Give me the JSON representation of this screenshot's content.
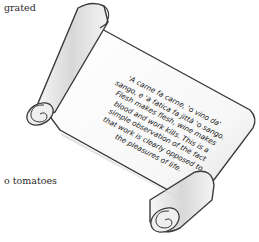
{
  "page": {
    "partial_text_top": "grated",
    "partial_text_bottom": "o tomatoes"
  },
  "scroll": {
    "quote_lines": [
      "'A carne fa carne, 'o vino da'",
      "sango, e 'a fatica fa jittà 'o sango.",
      "Flesh makes flesh, wine makes",
      "blood and work kills. This is a",
      "simple observation of the fact",
      "that work is clearly opposed to",
      "the pleasures of life."
    ]
  },
  "colors": {
    "paper": "#ffffff",
    "scroll_fill": "#f2f2f2",
    "scroll_shadow": "#cfcfcf",
    "scroll_outline": "#3a3a3a",
    "text": "#1a1a1a"
  }
}
